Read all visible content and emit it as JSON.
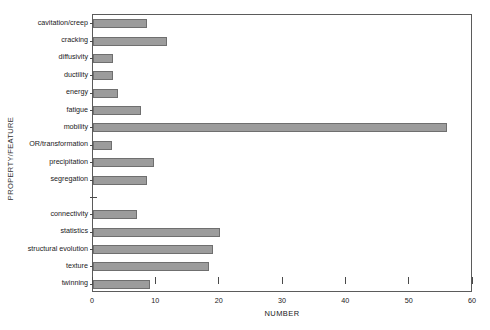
{
  "chart_data": {
    "type": "bar",
    "orientation": "horizontal",
    "title": "",
    "xlabel": "NUMBER",
    "ylabel": "PROPERTY/FEATURE",
    "xlim": [
      0,
      60
    ],
    "xticks": [
      0,
      10,
      20,
      30,
      40,
      50,
      60
    ],
    "xticklabels": [
      "0",
      "10",
      "20",
      "30",
      "40",
      "50",
      "60"
    ],
    "grid": false,
    "legend": null,
    "bar_color": "#9c9c9c",
    "bar_edge_color": "#6f6f6f",
    "axis_color": "#5b5b5b",
    "categories": [
      "cavitation/creep",
      "cracking",
      "diffusivity",
      "ductility",
      "energy",
      "fatigue",
      "mobility",
      "OR/transformation",
      "precipitation",
      "segregation",
      "",
      "connectivity",
      "statistics",
      "structural evolution",
      "texture",
      "twinning"
    ],
    "values": [
      8.5,
      11.7,
      3.2,
      3.2,
      4.0,
      7.6,
      55.9,
      3.0,
      9.6,
      8.6,
      0,
      6.9,
      20.0,
      19.0,
      18.3,
      9.0
    ]
  }
}
